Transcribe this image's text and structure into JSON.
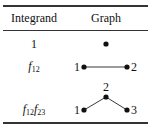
{
  "table": {
    "headers": {
      "integrand": "Integrand",
      "graph": "Graph"
    },
    "rows": [
      {
        "integrand": "1",
        "graph": {
          "vertices": [],
          "edges": [],
          "description": "single vertex"
        }
      },
      {
        "integrand_base": "f",
        "integrand_sub1": "12",
        "integrand": "f12",
        "graph": {
          "vertices": [
            "1",
            "2"
          ],
          "edges": [
            [
              "1",
              "2"
            ]
          ]
        }
      },
      {
        "integrand_base": "f",
        "integrand_sub1": "12",
        "integrand_base2": "f",
        "integrand_sub2": "23",
        "integrand": "f12f23",
        "graph": {
          "vertices": [
            "1",
            "2",
            "3"
          ],
          "edges": [
            [
              "1",
              "2"
            ],
            [
              "2",
              "3"
            ]
          ]
        }
      }
    ]
  },
  "labels": {
    "r2_v1": "1",
    "r2_v2": "2",
    "r3_v1": "1",
    "r3_v2": "2",
    "r3_v3": "3"
  },
  "colors": {
    "ink": "#111111",
    "rule": "#333333",
    "background": "#ffffff"
  }
}
